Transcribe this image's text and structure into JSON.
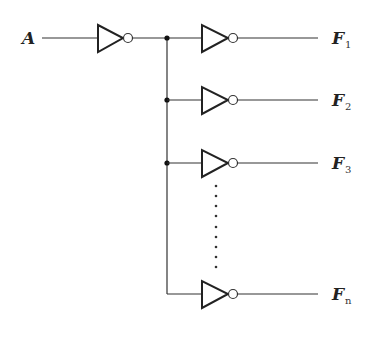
{
  "diagram": {
    "input": {
      "label": "A"
    },
    "outputs": [
      {
        "label": "F",
        "subscript": "1"
      },
      {
        "label": "F",
        "subscript": "2"
      },
      {
        "label": "F",
        "subscript": "3"
      },
      {
        "label": "F",
        "subscript": "n"
      }
    ],
    "gate_type": "NOT",
    "gate_count_visible": 5,
    "ellipsis": "vertical-dots",
    "colors": {
      "line": "#333333",
      "background": "#ffffff"
    }
  }
}
